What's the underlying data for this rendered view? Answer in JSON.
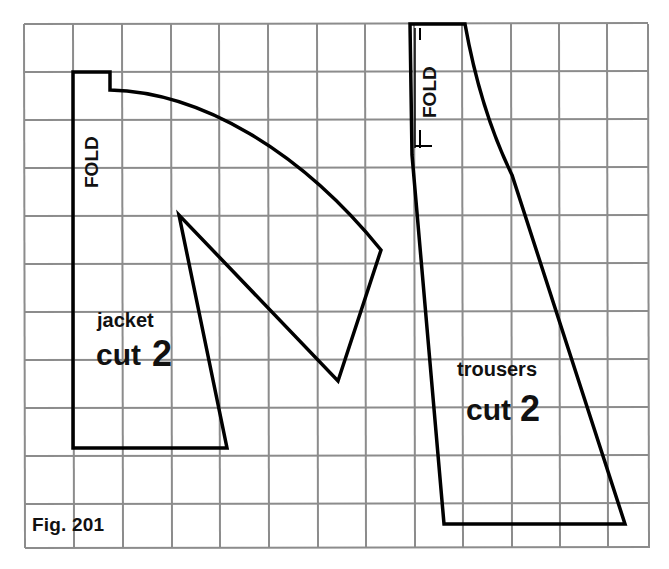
{
  "figure": {
    "caption": "Fig. 201",
    "grid": {
      "x_lines": [
        24,
        73,
        122,
        171,
        219,
        268,
        317,
        365,
        414,
        462,
        511,
        559,
        607,
        649
      ],
      "y_lines": [
        24,
        72,
        120,
        168,
        216,
        264,
        312,
        360,
        408,
        456,
        504,
        548
      ],
      "color": "#8c8c8c"
    },
    "pieces": {
      "jacket": {
        "name": "jacket",
        "instruction": "cut 2",
        "cut_word": "cut",
        "cut_count": "2",
        "fold_label": "FOLD"
      },
      "trousers": {
        "name": "trousers",
        "instruction": "cut 2",
        "cut_word": "cut",
        "cut_count": "2",
        "fold_label": "FOLD"
      }
    }
  }
}
